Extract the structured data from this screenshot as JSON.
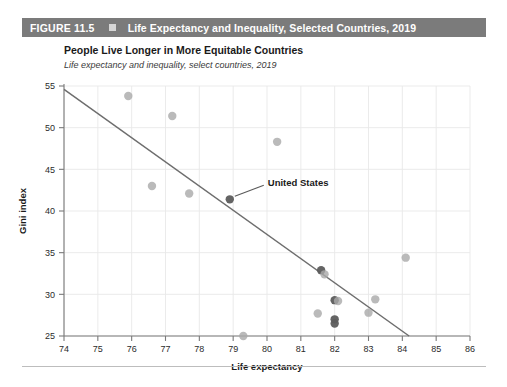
{
  "figure": {
    "number_label": "FIGURE 11.5",
    "bullet_icon": "square-bullet-icon",
    "title": "Life Expectancy and Inequality, Selected Countries, 2019",
    "header_bg": "#7b7b7b",
    "header_text_color": "#ffffff"
  },
  "chart_data": {
    "type": "scatter",
    "title": "People Live Longer in More Equitable Countries",
    "subtitle": "Life expectancy and inequality, select countries, 2019",
    "xlabel": "Life expectancy",
    "ylabel": "Gini index",
    "xlim": [
      74,
      86
    ],
    "ylim": [
      25,
      55
    ],
    "xticks": [
      74,
      75,
      76,
      77,
      78,
      79,
      80,
      81,
      82,
      83,
      84,
      85,
      86
    ],
    "yticks": [
      25,
      30,
      35,
      40,
      45,
      50,
      55
    ],
    "grid": true,
    "legend": "none",
    "point_color": "#a9a9a9",
    "highlight_color": "#5c5c5c",
    "trendline_color": "#6e6e6e",
    "points": [
      {
        "x": 75.9,
        "y": 53.8,
        "highlight": false
      },
      {
        "x": 77.2,
        "y": 51.4,
        "highlight": false
      },
      {
        "x": 76.6,
        "y": 43.0,
        "highlight": false
      },
      {
        "x": 77.7,
        "y": 42.1,
        "highlight": false
      },
      {
        "x": 80.3,
        "y": 48.3,
        "highlight": false
      },
      {
        "x": 78.9,
        "y": 41.4,
        "highlight": true,
        "label": "United States"
      },
      {
        "x": 79.3,
        "y": 25.0,
        "highlight": false
      },
      {
        "x": 81.5,
        "y": 27.7,
        "highlight": false
      },
      {
        "x": 81.6,
        "y": 32.9,
        "highlight": true
      },
      {
        "x": 81.7,
        "y": 32.4,
        "highlight": false
      },
      {
        "x": 82.0,
        "y": 29.3,
        "highlight": true
      },
      {
        "x": 82.0,
        "y": 27.0,
        "highlight": true
      },
      {
        "x": 82.0,
        "y": 26.5,
        "highlight": true
      },
      {
        "x": 82.1,
        "y": 29.2,
        "highlight": false
      },
      {
        "x": 83.0,
        "y": 27.8,
        "highlight": false
      },
      {
        "x": 83.2,
        "y": 29.4,
        "highlight": false
      },
      {
        "x": 84.1,
        "y": 34.4,
        "highlight": false
      }
    ],
    "trendline": {
      "x0": 74.0,
      "y0": 54.6,
      "x1": 84.2,
      "y1": 25.0
    }
  },
  "annotations": [
    {
      "text": "United States",
      "target_x": 78.9,
      "target_y": 41.4
    }
  ]
}
